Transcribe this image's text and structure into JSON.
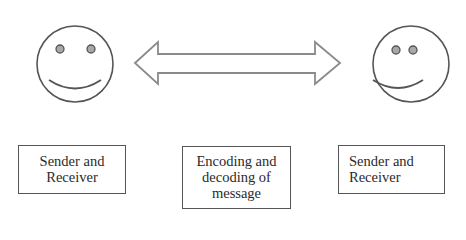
{
  "diagram": {
    "title": "",
    "left_party": {
      "icon": "smiley-face-icon",
      "label_lines": [
        "Sender and",
        "Receiver"
      ]
    },
    "channel": {
      "icon": "double-headed-arrow-icon",
      "label_lines": [
        "Encoding and",
        "decoding of",
        "message"
      ]
    },
    "right_party": {
      "icon": "smiley-face-icon",
      "label_lines": [
        "Sender and",
        "Receiver"
      ]
    },
    "colors": {
      "outline": "#555555",
      "eye_fill": "#a8a8a8",
      "arrow_outline": "#888888",
      "text": "#2a2a2a"
    }
  }
}
